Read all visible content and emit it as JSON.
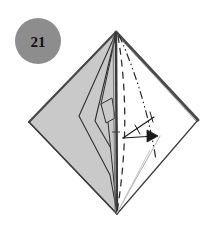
{
  "figure": {
    "type": "origami-fold-diagram",
    "caption_step_label": "21",
    "background_color": "#ffffff"
  },
  "step_badge": {
    "name": "step-number-badge",
    "label": "21",
    "shape": "circle",
    "fill_color": "#8d8d8d",
    "text_color": "#111111",
    "center_x": 38,
    "center_y": 41,
    "radius": 23
  },
  "model": {
    "name": "origami-kite-model",
    "apex": {
      "x": 116,
      "y": 32
    },
    "bottom": {
      "x": 117,
      "y": 214
    },
    "left_vertex": {
      "x": 29,
      "y": 122
    },
    "right_vertex": {
      "x": 198,
      "y": 120
    },
    "shaded_fill": "#c9c9c9",
    "white_fill": "#ffffff",
    "outline_color": "#3a3a3a",
    "thick_edge_color": "#4a4a4a"
  },
  "panels": [
    {
      "name": "left-shaded-panel",
      "fill": "#c9c9c9",
      "description": "large gray left half of the kite"
    },
    {
      "name": "left-inner-sliver-a",
      "fill": "#c9c9c9",
      "description": "narrow folded flap sliver near center spine"
    },
    {
      "name": "left-inner-sliver-b",
      "fill": "#c9c9c9",
      "description": "second narrow folded flap sliver"
    },
    {
      "name": "right-white-panel",
      "fill": "#ffffff",
      "description": "white right half of the kite"
    }
  ],
  "fold_lines": [
    {
      "name": "valley-fold-line",
      "style": "dashed",
      "color": "#2b2b2b",
      "description": "dashed valley fold from apex down to bottom vertex"
    },
    {
      "name": "mountain-fold-line",
      "style": "dash-dot-dot",
      "color": "#2b2b2b",
      "description": "dash-dot-dot mountain fold from apex curving to lower right"
    },
    {
      "name": "reference-crease-line",
      "style": "solid-thin",
      "color": "#a9a9a9",
      "description": "faint gray reference crease to bottom vertex"
    },
    {
      "name": "center-spine-line",
      "style": "solid",
      "color": "#3a3a3a",
      "description": "vertical center spine from apex to bottom vertex"
    }
  ],
  "arrows": [
    {
      "name": "fold-direction-arrow",
      "style": "open-head-arrow",
      "color": "#1a1a1a",
      "direction": "right",
      "from": {
        "x": 123,
        "y": 137
      },
      "to": {
        "x": 156,
        "y": 134
      },
      "description": "thin arrow indicating the flap folds to the right"
    },
    {
      "name": "fold-return-stroke",
      "style": "thin-line",
      "color": "#1a1a1a",
      "from": {
        "x": 123,
        "y": 137
      },
      "to": {
        "x": 153,
        "y": 117
      },
      "description": "upper stroke of the fold arrow forming a narrow V"
    }
  ]
}
